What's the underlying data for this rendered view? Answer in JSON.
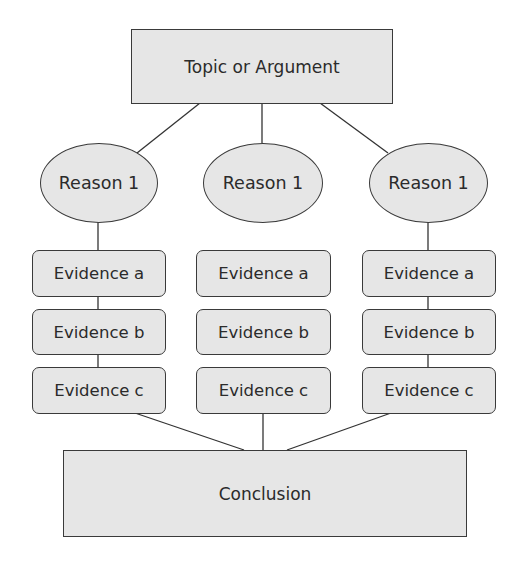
{
  "diagram": {
    "type": "argument-structure",
    "colors": {
      "fill": "#e6e6e6",
      "stroke": "#3a3a3a",
      "text": "#2b2b2b",
      "background": "#ffffff"
    },
    "topic": {
      "label": "Topic or Argument"
    },
    "reasons": [
      {
        "label": "Reason 1",
        "evidence": [
          "Evidence a",
          "Evidence b",
          "Evidence c"
        ]
      },
      {
        "label": "Reason 1",
        "evidence": [
          "Evidence a",
          "Evidence b",
          "Evidence c"
        ]
      },
      {
        "label": "Reason 1",
        "evidence": [
          "Evidence a",
          "Evidence b",
          "Evidence c"
        ]
      }
    ],
    "conclusion": {
      "label": "Conclusion"
    }
  }
}
